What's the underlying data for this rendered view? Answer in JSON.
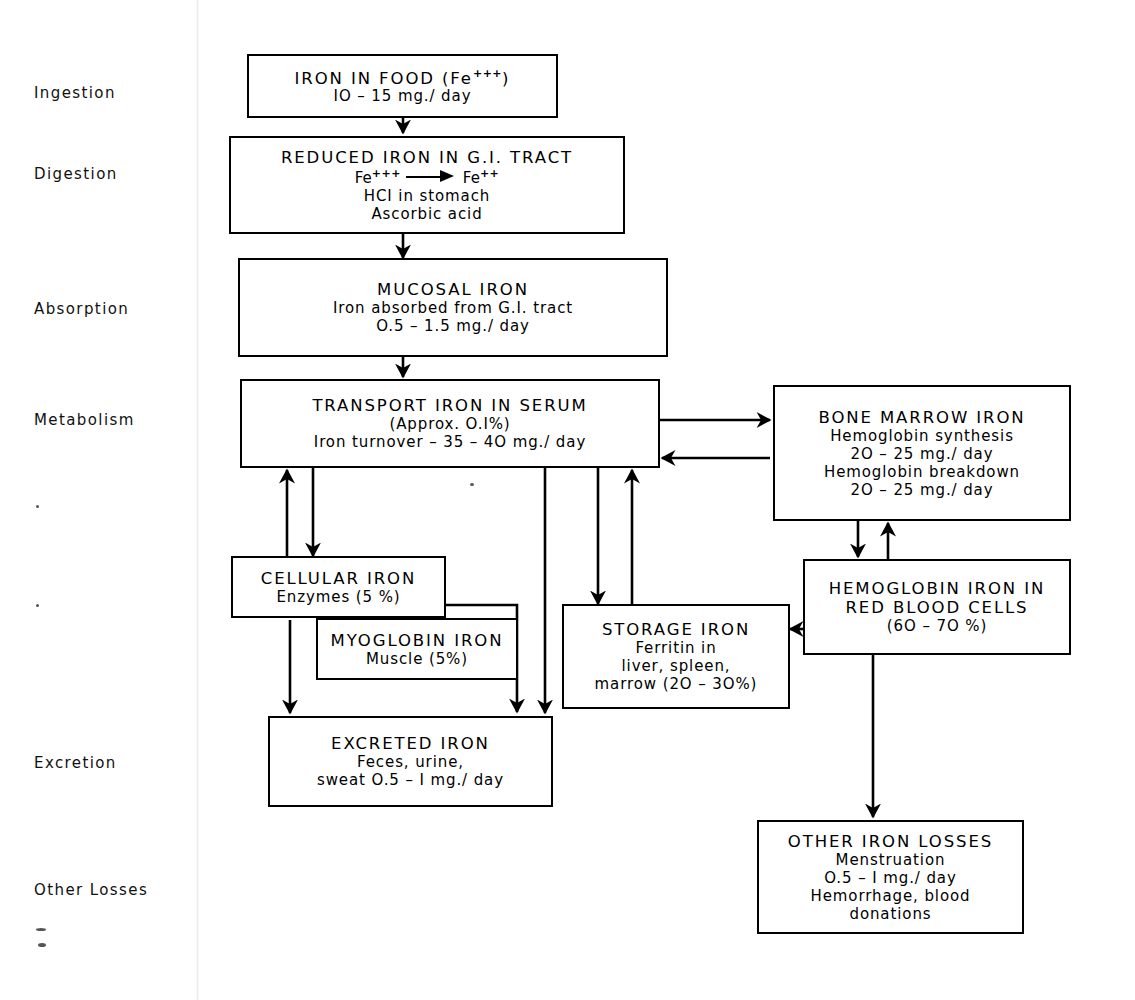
{
  "diagram": {
    "stage_labels": [
      {
        "id": "ingestion",
        "text": "Ingestion"
      },
      {
        "id": "digestion",
        "text": "Digestion"
      },
      {
        "id": "absorption",
        "text": "Absorption"
      },
      {
        "id": "metabolism",
        "text": "Metabolism"
      },
      {
        "id": "excretion",
        "text": "Excretion"
      },
      {
        "id": "other-losses",
        "text": "Other Losses"
      }
    ],
    "nodes": {
      "iron_in_food": {
        "heading": "IRON IN FOOD  (Fe",
        "heading_sup": "+++",
        "heading_tail": ")",
        "line2": "IO – 15 mg./ day"
      },
      "reduced_iron": {
        "heading": "REDUCED IRON IN G.I. TRACT",
        "fe_left": "Fe",
        "fe_left_sup": "+++",
        "fe_right": "Fe",
        "fe_right_sup": "++",
        "line3": "HCI in stomach",
        "line4": "Ascorbic acid"
      },
      "mucosal_iron": {
        "heading": "MUCOSAL IRON",
        "line2": "Iron absorbed from G.I. tract",
        "line3": "O.5 – 1.5 mg./ day"
      },
      "transport_iron": {
        "heading": "TRANSPORT IRON IN SERUM",
        "line2": "(Approx. O.I%)",
        "line3": "Iron turnover – 35 – 4O mg./ day"
      },
      "bone_marrow_iron": {
        "heading": "BONE  MARROW IRON",
        "line2": "Hemoglobin synthesis",
        "line3": "2O – 25 mg./ day",
        "line4": "Hemoglobin breakdown",
        "line5": "2O – 25 mg./ day"
      },
      "cellular_iron": {
        "heading": "CELLULAR IRON",
        "line2": "Enzymes  (5 %)"
      },
      "myoglobin_iron": {
        "heading": "MYOGLOBIN IRON",
        "line2": "Muscle      (5%)"
      },
      "storage_iron": {
        "heading": "STORAGE IRON",
        "line2": "Ferritin in",
        "line3": "liver, spleen,",
        "line4": "marrow (2O – 3O%)"
      },
      "hemoglobin_iron_rbc": {
        "heading": "HEMOGLOBIN  IRON IN",
        "line2": "RED BLOOD CELLS",
        "line3": "(6O – 7O %)"
      },
      "excreted_iron": {
        "heading": "EXCRETED IRON",
        "line2": "Feces, urine,",
        "line3": "sweat  O.5 – I mg./ day"
      },
      "other_iron_losses": {
        "heading": "OTHER IRON LOSSES",
        "line2": "Menstruation",
        "line3": "O.5 – I mg./ day",
        "line4": "Hemorrhage, blood",
        "line5": "donations"
      }
    },
    "colors": {
      "ink": "#000000",
      "paper": "#ffffff"
    }
  }
}
